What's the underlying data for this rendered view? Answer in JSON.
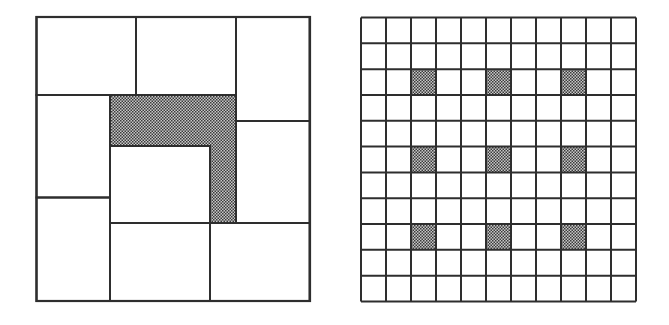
{
  "colors": {
    "line": "#2e2e2e",
    "shade_dark": "#3a3a3a",
    "shade_light": "#c8c8c8",
    "background": "#ffffff"
  },
  "figures": [
    {
      "name": "square-dissection",
      "frame": {
        "x": 36.5,
        "y": 17,
        "w": 273.5,
        "h": 284
      },
      "rectangles": [
        {
          "x": 36.5,
          "y": 17,
          "w": 99.5,
          "h": 78,
          "shaded": false
        },
        {
          "x": 136,
          "y": 17,
          "w": 100,
          "h": 78,
          "shaded": false
        },
        {
          "x": 236,
          "y": 17,
          "w": 73.5,
          "h": 104,
          "shaded": false
        },
        {
          "x": 36.5,
          "y": 95,
          "w": 73.5,
          "h": 102.5,
          "shaded": false
        },
        {
          "x": 236,
          "y": 121,
          "w": 73.5,
          "h": 102,
          "shaded": false
        },
        {
          "x": 36.5,
          "y": 197.5,
          "w": 73.5,
          "h": 103.5,
          "shaded": false
        },
        {
          "x": 110,
          "y": 146,
          "w": 100,
          "h": 77,
          "shaded": false
        },
        {
          "x": 110,
          "y": 223,
          "w": 100,
          "h": 78,
          "shaded": false
        },
        {
          "x": 210,
          "y": 223,
          "w": 99.5,
          "h": 78,
          "shaded": false
        }
      ],
      "shaded_polygon": "110,95 236,95 236,223 210,223 210,146 110,146"
    },
    {
      "name": "grid-11x11",
      "frame": {
        "x": 361,
        "y": 17.5,
        "w": 275,
        "h": 284
      },
      "rows": 11,
      "cols": 11,
      "shaded_cells": [
        [
          2,
          2
        ],
        [
          2,
          5
        ],
        [
          2,
          8
        ],
        [
          5,
          2
        ],
        [
          5,
          5
        ],
        [
          5,
          8
        ],
        [
          8,
          2
        ],
        [
          8,
          5
        ],
        [
          8,
          8
        ]
      ]
    }
  ]
}
